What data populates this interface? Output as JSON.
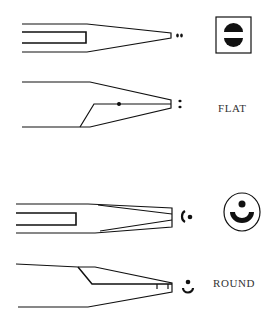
{
  "diagram": {
    "type": "technical-illustration",
    "colors": {
      "ink": "#111111",
      "background": "#ffffff",
      "label": "#333333"
    },
    "groups": [
      {
        "id": "flat",
        "label": "FLAT",
        "views": [
          "top-view",
          "side-view"
        ],
        "cross_section_icon": "flat-cross-section-icon (square frame with two half-discs)",
        "tip_markers": [
          "two-dots-horizontal",
          "two-dots-vertical"
        ]
      },
      {
        "id": "round",
        "label": "ROUND",
        "views": [
          "top-view",
          "side-view"
        ],
        "cross_section_icon": "round-cross-section-icon (circle with dot and crescent)",
        "tip_markers": [
          "crescent-dot-horizontal",
          "dot-crescent-vertical"
        ]
      }
    ]
  }
}
